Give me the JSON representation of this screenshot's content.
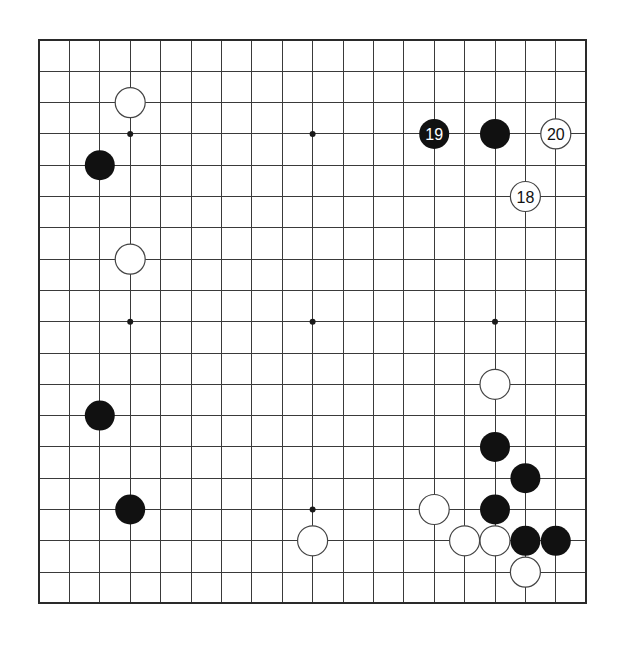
{
  "board": {
    "size": 19,
    "origin": {
      "x": 39,
      "y": 40
    },
    "spacing": {
      "x": 30.4,
      "y": 31.3
    },
    "stone_radius": 15,
    "colors": {
      "background": "#ffffff",
      "line": "#3a3a3a",
      "black_stone": "#111111",
      "white_stone": "#ffffff"
    },
    "star_points": [
      {
        "col": 3,
        "row": 3
      },
      {
        "col": 9,
        "row": 3
      },
      {
        "col": 15,
        "row": 3
      },
      {
        "col": 3,
        "row": 9
      },
      {
        "col": 9,
        "row": 9
      },
      {
        "col": 15,
        "row": 9
      },
      {
        "col": 3,
        "row": 15
      },
      {
        "col": 9,
        "row": 15
      },
      {
        "col": 15,
        "row": 15
      }
    ],
    "stones": [
      {
        "color": "white",
        "col": 3,
        "row": 2,
        "label": ""
      },
      {
        "color": "black",
        "col": 2,
        "row": 4,
        "label": ""
      },
      {
        "color": "white",
        "col": 3,
        "row": 7,
        "label": ""
      },
      {
        "color": "black",
        "col": 2,
        "row": 12,
        "label": ""
      },
      {
        "color": "black",
        "col": 3,
        "row": 15,
        "label": ""
      },
      {
        "color": "white",
        "col": 9,
        "row": 16,
        "label": ""
      },
      {
        "color": "black",
        "col": 13,
        "row": 3,
        "label": "19"
      },
      {
        "color": "black",
        "col": 15,
        "row": 3,
        "label": ""
      },
      {
        "color": "white",
        "col": 17,
        "row": 3,
        "label": "20"
      },
      {
        "color": "white",
        "col": 16,
        "row": 5,
        "label": "18"
      },
      {
        "color": "white",
        "col": 15,
        "row": 11,
        "label": ""
      },
      {
        "color": "black",
        "col": 15,
        "row": 13,
        "label": ""
      },
      {
        "color": "black",
        "col": 16,
        "row": 14,
        "label": ""
      },
      {
        "color": "white",
        "col": 13,
        "row": 15,
        "label": ""
      },
      {
        "color": "black",
        "col": 15,
        "row": 15,
        "label": ""
      },
      {
        "color": "white",
        "col": 14,
        "row": 16,
        "label": ""
      },
      {
        "color": "white",
        "col": 15,
        "row": 16,
        "label": ""
      },
      {
        "color": "black",
        "col": 16,
        "row": 16,
        "label": ""
      },
      {
        "color": "black",
        "col": 17,
        "row": 16,
        "label": ""
      },
      {
        "color": "white",
        "col": 16,
        "row": 17,
        "label": ""
      }
    ]
  }
}
